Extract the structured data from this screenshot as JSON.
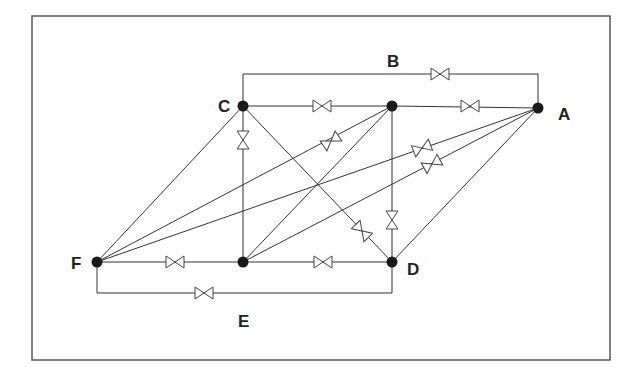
{
  "diagram": {
    "title": "",
    "frame": {
      "x": 32,
      "y": 16,
      "width": 578,
      "height": 344
    },
    "colors": {
      "line": "#333333",
      "node": "#1a1a1a",
      "frame": "#4a4a4a"
    },
    "nodes": [
      {
        "id": "C",
        "label": "C",
        "x": 243,
        "y": 106,
        "label_x": 218,
        "label_y": 112
      },
      {
        "id": "N2",
        "label": "",
        "x": 392,
        "y": 106
      },
      {
        "id": "A",
        "label": "A",
        "x": 538,
        "y": 108,
        "label_x": 558,
        "label_y": 120
      },
      {
        "id": "F",
        "label": "F",
        "x": 97,
        "y": 262,
        "label_x": 71,
        "label_y": 269
      },
      {
        "id": "N5",
        "label": "",
        "x": 243,
        "y": 262
      },
      {
        "id": "D",
        "label": "D",
        "x": 392,
        "y": 262,
        "label_x": 407,
        "label_y": 275
      }
    ],
    "loop_labels": [
      {
        "id": "B",
        "label": "B",
        "x": 387,
        "y": 67
      },
      {
        "id": "E",
        "label": "E",
        "x": 238,
        "y": 327
      }
    ],
    "pipes": [
      {
        "from": "C",
        "to": "N2",
        "valve": {
          "x": 322,
          "y": 106,
          "angle": 0
        }
      },
      {
        "from": "N2",
        "to": "A",
        "valve": {
          "x": 470,
          "y": 106,
          "angle": 0
        }
      },
      {
        "from": "F",
        "to": "N5",
        "valve": {
          "x": 175,
          "y": 262,
          "angle": 0
        }
      },
      {
        "from": "N5",
        "to": "D",
        "valve": {
          "x": 323,
          "y": 262,
          "angle": 0
        }
      },
      {
        "from": "C",
        "to": "N5",
        "valve": {
          "x": 243,
          "y": 140,
          "angle": 90
        }
      },
      {
        "from": "N2",
        "to": "D",
        "valve": {
          "x": 392,
          "y": 220,
          "angle": 90
        }
      },
      {
        "from": "C",
        "to": "D",
        "valve": {
          "x": 362,
          "y": 231,
          "angle": 46
        }
      },
      {
        "from": "F",
        "to": "C",
        "valve": null
      },
      {
        "from": "F",
        "to": "N2",
        "valve": {
          "x": 331,
          "y": 141,
          "angle": -34
        }
      },
      {
        "from": "F",
        "to": "A",
        "valve": {
          "x": 422,
          "y": 148,
          "angle": -21
        }
      },
      {
        "from": "N5",
        "to": "N2",
        "valve": null
      },
      {
        "from": "N5",
        "to": "A",
        "valve": {
          "x": 432,
          "y": 164,
          "angle": -29
        }
      },
      {
        "from": "D",
        "to": "A",
        "valve": null
      }
    ],
    "bypass_loops": [
      {
        "id": "B",
        "points": [
          [
            243,
            106
          ],
          [
            243,
            74
          ],
          [
            538,
            74
          ],
          [
            538,
            108
          ]
        ],
        "valve": {
          "x": 440,
          "y": 74,
          "angle": 0
        }
      },
      {
        "id": "E",
        "points": [
          [
            97,
            262
          ],
          [
            97,
            293
          ],
          [
            392,
            293
          ],
          [
            392,
            262
          ]
        ],
        "valve": {
          "x": 204,
          "y": 293,
          "angle": 0
        }
      }
    ]
  }
}
